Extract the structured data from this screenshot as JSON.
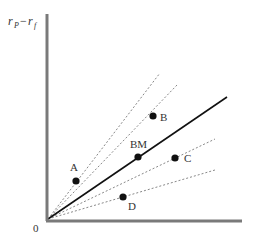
{
  "diagram": {
    "type": "security-market-line-comparison",
    "y_axis_label": {
      "main": "r",
      "sub1": "P",
      "minus": "−",
      "main2": "r",
      "sub2": "f"
    },
    "origin_label": "0",
    "colors": {
      "axis": "#7a7a7a",
      "solid_line": "#111111",
      "dashed_line": "#888888",
      "point": "#111111",
      "text": "#333333"
    },
    "origin": {
      "x": 48,
      "y": 219
    },
    "axes": {
      "x_end": 242,
      "y_top": 14
    },
    "benchmark_line": {
      "label": "BM",
      "end": {
        "x": 227,
        "y": 97
      }
    },
    "points": [
      {
        "label": "A",
        "x": 76,
        "y": 181,
        "line_end": {
          "x": 160,
          "y": 73
        },
        "label_dx": -6,
        "label_dy": -10
      },
      {
        "label": "B",
        "x": 153,
        "y": 116,
        "line_end": {
          "x": 177,
          "y": 85
        },
        "label_dx": 7,
        "label_dy": 4
      },
      {
        "label": "BM",
        "x": 138,
        "y": 157,
        "label_dx": -6,
        "label_dy": -9
      },
      {
        "label": "C",
        "x": 175,
        "y": 158,
        "line_end": {
          "x": 215,
          "y": 139
        },
        "label_dx": 9,
        "label_dy": 4
      },
      {
        "label": "D",
        "x": 123,
        "y": 197,
        "line_end": {
          "x": 215,
          "y": 170
        },
        "label_dx": 5,
        "label_dy": 13
      }
    ]
  }
}
